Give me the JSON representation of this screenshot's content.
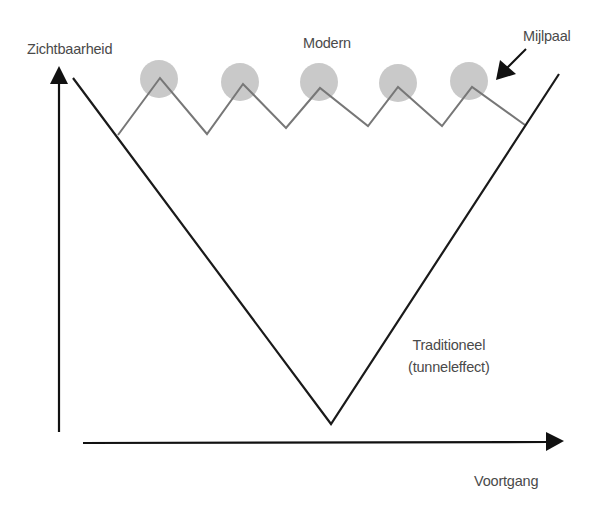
{
  "diagram": {
    "type": "concept-diagram",
    "title": "",
    "y_axis_label": "Zichtbaarheid",
    "x_axis_label": "Voortgang",
    "series": [
      {
        "name": "Modern",
        "style": "zigzag",
        "color": "#777777",
        "points": [
          [
            118,
            135
          ],
          [
            160,
            78
          ],
          [
            207,
            134
          ],
          [
            243,
            84
          ],
          [
            286,
            128
          ],
          [
            320,
            88
          ],
          [
            368,
            126
          ],
          [
            398,
            87
          ],
          [
            442,
            126
          ],
          [
            472,
            87
          ],
          [
            525,
            125
          ]
        ],
        "milestones": [
          [
            159,
            79
          ],
          [
            240,
            82
          ],
          [
            319,
            82
          ],
          [
            398,
            83
          ],
          [
            469,
            81
          ]
        ],
        "milestone_color": "#c9c9c9",
        "milestone_radius": 19
      },
      {
        "name": "Traditioneel (tunneleffect)",
        "style": "v-shape",
        "color": "#1a1a1a",
        "points": [
          [
            73,
            78
          ],
          [
            331,
            424
          ],
          [
            559,
            74
          ]
        ]
      }
    ],
    "labels": {
      "modern": "Modern",
      "milestone": "Mijlpaal",
      "traditional_line1": "Traditioneel",
      "traditional_line2": "(tunneleffect)"
    },
    "colors": {
      "axis": "#111111",
      "text": "#4a4a4a",
      "background": "#ffffff"
    }
  }
}
